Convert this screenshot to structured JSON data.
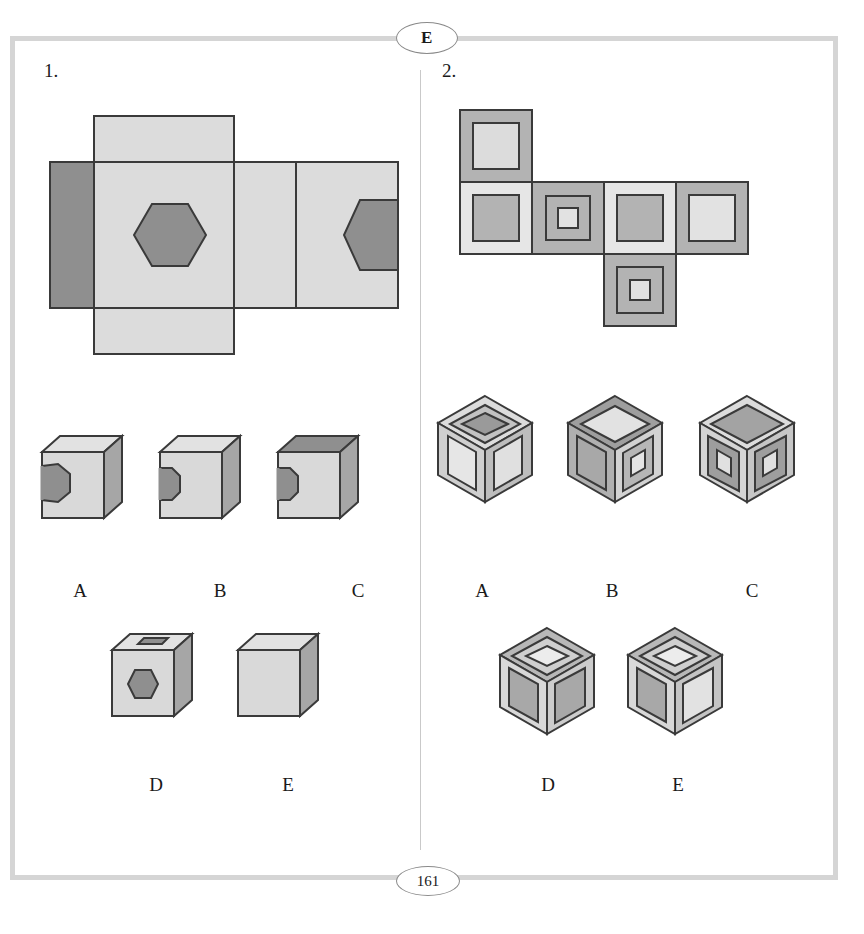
{
  "page": {
    "header_badge": "E",
    "footer_badge": "161",
    "background_color": "#ffffff",
    "frame_color": "#d5d5d5",
    "divider_color": "#c9c9c9"
  },
  "palette": {
    "outline": "#3a3a3a",
    "light_gray": "#dcdcdc",
    "mid_gray": "#b3b3b3",
    "dark_gray": "#8c8c8c",
    "darker_gray": "#7a7a7a",
    "face_light": "#d9d9d9",
    "face_mid": "#c2c2c2",
    "face_shadow": "#a6a6a6",
    "face_top": "#e2e2e2",
    "face_top_dark": "#8f8f8f"
  },
  "problems": [
    {
      "number": "1.",
      "net": {
        "description": "unfolded cube net, cross-like, hexagon on one face and partial hexagon on another",
        "panels": [
          {
            "name": "top-flap",
            "fill": "light_gray",
            "marks": []
          },
          {
            "name": "left-flap",
            "fill": "dark_gray",
            "marks": []
          },
          {
            "name": "center-face",
            "fill": "light_gray",
            "marks": [
              "full-hexagon"
            ]
          },
          {
            "name": "middle-face",
            "fill": "light_gray",
            "marks": []
          },
          {
            "name": "right-face",
            "fill": "light_gray",
            "marks": [
              "half-hexagon-right-edge"
            ]
          },
          {
            "name": "bottom-flap",
            "fill": "light_gray",
            "marks": []
          }
        ]
      },
      "options": [
        {
          "label": "A",
          "front_mark": "half-hexagon-left-edge-large",
          "top_face": "light",
          "note": "hexagon clipped at left edge of front face"
        },
        {
          "label": "B",
          "front_mark": "half-hexagon-left-edge-small",
          "top_face": "light",
          "note": "small partial hexagon at left edge"
        },
        {
          "label": "C",
          "front_mark": "half-hexagon-left-edge-small",
          "top_face": "dark",
          "note": "dark top face, small partial hexagon at left edge"
        },
        {
          "label": "D",
          "front_mark": "full-hexagon",
          "top_face": "light",
          "note": "full hexagon on front, partial hexagon on top face"
        },
        {
          "label": "E",
          "front_mark": "none",
          "top_face": "light",
          "note": "blank cube"
        }
      ]
    },
    {
      "number": "2.",
      "net": {
        "description": "unfolded cube net with nested square patterns, T/cross arrangement",
        "panels": [
          {
            "name": "net-cell-top",
            "row": 0,
            "col": 0,
            "outer": "mid_gray",
            "inner": "light_gray",
            "rings": 1
          },
          {
            "name": "net-cell-mid-1",
            "row": 1,
            "col": 0,
            "outer": "light_gray",
            "inner": "mid_gray",
            "rings": 1
          },
          {
            "name": "net-cell-mid-2",
            "row": 1,
            "col": 1,
            "outer": "mid_gray",
            "inner": "light_gray",
            "rings": 2
          },
          {
            "name": "net-cell-mid-3",
            "row": 1,
            "col": 2,
            "outer": "light_gray",
            "inner": "mid_gray",
            "rings": 1
          },
          {
            "name": "net-cell-mid-4",
            "row": 1,
            "col": 3,
            "outer": "mid_gray",
            "inner": "light_gray",
            "rings": 1
          },
          {
            "name": "net-cell-bottom",
            "row": 2,
            "col": 2,
            "outer": "mid_gray",
            "inner": "light_gray",
            "rings": 2
          }
        ]
      },
      "options": [
        {
          "label": "A",
          "top": "dark-center-triple-ring",
          "left": "light-center",
          "right": "light-center"
        },
        {
          "label": "B",
          "top": "light-center",
          "left": "solid-dark",
          "right": "nested-double"
        },
        {
          "label": "C",
          "top": "dark-center",
          "left": "nested-double",
          "right": "nested-double"
        },
        {
          "label": "D",
          "top": "light-center-triple-ring",
          "left": "mid-center",
          "right": "mid-center"
        },
        {
          "label": "E",
          "top": "light-center-triple-ring",
          "left": "mid-center",
          "right": "light-center"
        }
      ]
    }
  ]
}
